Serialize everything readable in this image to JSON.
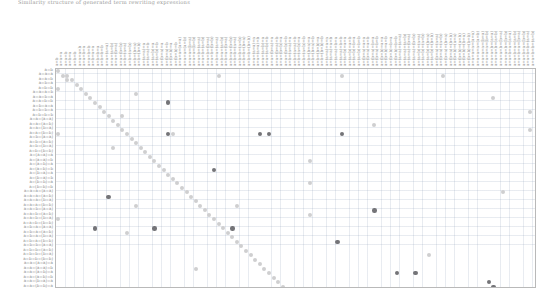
{
  "caption": {
    "text": "Similarity structure of generated term rewriting expressions"
  },
  "chart_data": {
    "type": "heatmap",
    "title": "",
    "xlabel": "",
    "ylabel": "",
    "grid": true,
    "legend": null,
    "n_rows": 49,
    "n_cols": 105,
    "cell_width_px": 4.58,
    "cell_height_px": 4.49,
    "colors": {
      "light_dot": "#d8d8d8",
      "mid_dot": "#c2c2c2",
      "dark_dot": "#6f6f73",
      "grid_line": "#c6cede",
      "panel_border": "#b9b9b9",
      "label_text": "#8e8e8e"
    },
    "row_labels": [
      "a=b",
      "a=a=a",
      "a=a=b",
      "a=b=a",
      "a=b=b",
      "a=a=a=b",
      "a=a=b=a",
      "a=a=b=b",
      "a=b=a=a",
      "a=b=b=a",
      "a=b=b=b",
      "a=a=(a=a)",
      "a=a=(a=b)",
      "a=a=(b=a)",
      "a=a=(b=b)",
      "a=b=(a=a)",
      "a=b=(a=b)",
      "a=b=(b=a)",
      "a=b=(b=b)",
      "a=(a=a)=a",
      "a=(a=a)=b",
      "a=(a=b)=a",
      "a=(a=b)=b",
      "a=(b=a)=a",
      "a=(b=a)=b",
      "a=(b=b)=a",
      "a=(b=b)=b",
      "a=a=a=(a=a)",
      "a=a=a=(a=b)",
      "a=a=a=(b=a)",
      "a=a=a=(b=b)",
      "a=a=b=(a=a)",
      "a=a=b=(a=b)",
      "a=a=b=(b=a)",
      "a=a=b=(b=b)",
      "a=b=a=(a=a)",
      "a=b=a=(a=b)",
      "a=b=a=(b=a)",
      "a=b=a=(b=b)",
      "a=b=b=(a=a)",
      "a=b=b=(a=b)",
      "a=b=b=(b=a)",
      "a=b=b=(b=b)",
      "a=a=(a=a)=a",
      "a=a=(a=a)=b",
      "a=a=(a=b)=a",
      "a=a=(a=b)=b",
      "a=a=(b=a)=a",
      "a=a=(b=b)=a"
    ],
    "col_labels": [
      "a=b",
      "a=a=a",
      "a=a=b",
      "a=b=a",
      "a=b=b",
      "a=a=a=b",
      "a=a=b=a",
      "a=a=b=b",
      "a=b=a=a",
      "a=b=b=a",
      "a=b=b=b",
      "a=a=(a=a)",
      "a=a=(a=b)",
      "a=a=(b=a)",
      "a=a=(b=b)",
      "a=b=(a=a)",
      "a=b=(a=b)",
      "a=b=(b=a)",
      "a=b=(b=b)",
      "a=(a=a)=a",
      "a=(a=a)=b",
      "a=(a=b)=a",
      "a=(a=b)=b",
      "a=(b=a)=a",
      "a=(b=a)=b",
      "a=(b=b)=a",
      "a=(b=b)=b",
      "a=a=a=(a=a)",
      "a=a=a=(a=b)",
      "a=a=a=(b=a)",
      "a=a=a=(b=b)",
      "a=a=b=(a=a)",
      "a=a=b=(a=b)",
      "a=a=b=(b=a)",
      "a=a=b=(b=b)",
      "a=b=a=(a=a)",
      "a=b=a=(a=b)",
      "a=b=a=(b=a)",
      "a=b=a=(b=b)",
      "a=b=b=(a=a)",
      "a=b=b=(a=b)",
      "a=b=b=(b=a)",
      "a=b=b=(b=b)",
      "a=a=(a=a)=a",
      "a=a=(a=a)=b",
      "a=a=(a=b)=a",
      "a=a=(a=b)=b",
      "a=a=(b=a)=a",
      "a=a=(b=a)=b",
      "a=a=(b=b)=a",
      "a=a=(b=b)=b",
      "a=b=(a=a)=a",
      "a=b=(a=a)=b",
      "a=b=(a=b)=a",
      "a=b=(a=b)=b",
      "a=b=(b=a)=a",
      "a=b=(b=a)=b",
      "a=b=(b=b)=a",
      "a=b=(b=b)=b",
      "a=(a=a)=a=a",
      "a=(a=a)=a=b",
      "a=(a=a)=b=a",
      "a=(a=a)=b=b",
      "a=(a=b)=a=a",
      "a=(a=b)=a=b",
      "a=(a=b)=b=a",
      "a=(a=b)=b=b",
      "a=(b=a)=a=a",
      "a=(b=a)=a=b",
      "a=(b=a)=b=a",
      "a=(b=a)=b=b",
      "a=(b=b)=a=a",
      "a=(b=b)=a=b",
      "a=(b=b)=b=a",
      "a=(b=b)=b=b",
      "a=(a=a)=(a=a)",
      "a=(a=a)=(a=b)",
      "a=(a=a)=(b=a)",
      "a=(a=a)=(b=b)",
      "a=(a=b)=(a=a)",
      "a=(a=b)=(a=b)",
      "a=(a=b)=(b=a)",
      "a=(a=b)=(b=b)",
      "a=(b=a)=(a=a)",
      "a=(b=a)=(a=b)",
      "a=(b=a)=(b=a)",
      "a=(b=a)=(b=b)",
      "a=(b=b)=(a=a)",
      "a=(b=b)=(a=b)",
      "a=(b=b)=(b=a)",
      "a=(b=b)=(b=b)",
      "a=a=a=a=(a=a)",
      "a=a=a=a=(a=b)",
      "a=a=a=a=(b=a)",
      "a=a=a=a=(b=b)",
      "a=a=a=b=(a=a)",
      "a=a=a=b=(a=b)",
      "a=a=a=b=(b=a)",
      "a=a=a=b=(b=b)",
      "a=a=b=a=(a=a)",
      "a=a=b=a=(a=b)",
      "a=a=b=a=(b=a)",
      "a=a=b=a=(b=b)",
      "a=a=b=b=(a=a)",
      "a=a=b=b=(a=b)"
    ],
    "points": [
      {
        "r": 0,
        "c": 0,
        "v": 0.3
      },
      {
        "r": 1,
        "c": 1,
        "v": 0.3
      },
      {
        "r": 1,
        "c": 2,
        "v": 0.3
      },
      {
        "r": 1,
        "c": 35,
        "v": 0.3
      },
      {
        "r": 1,
        "c": 62,
        "v": 0.3
      },
      {
        "r": 1,
        "c": 84,
        "v": 0.3
      },
      {
        "r": 2,
        "c": 2,
        "v": 0.3
      },
      {
        "r": 2,
        "c": 3,
        "v": 0.3
      },
      {
        "r": 3,
        "c": 4,
        "v": 0.3
      },
      {
        "r": 4,
        "c": 0,
        "v": 0.3
      },
      {
        "r": 4,
        "c": 5,
        "v": 0.3
      },
      {
        "r": 5,
        "c": 6,
        "v": 0.3
      },
      {
        "r": 5,
        "c": 17,
        "v": 0.3
      },
      {
        "r": 6,
        "c": 7,
        "v": 0.3
      },
      {
        "r": 6,
        "c": 95,
        "v": 0.3
      },
      {
        "r": 7,
        "c": 8,
        "v": 0.3
      },
      {
        "r": 7,
        "c": 24,
        "v": 0.82
      },
      {
        "r": 8,
        "c": 9,
        "v": 0.3
      },
      {
        "r": 9,
        "c": 10,
        "v": 0.3
      },
      {
        "r": 9,
        "c": 103,
        "v": 0.3
      },
      {
        "r": 10,
        "c": 11,
        "v": 0.3
      },
      {
        "r": 10,
        "c": 14,
        "v": 0.3
      },
      {
        "r": 11,
        "c": 12,
        "v": 0.3
      },
      {
        "r": 12,
        "c": 13,
        "v": 0.3
      },
      {
        "r": 12,
        "c": 69,
        "v": 0.3
      },
      {
        "r": 13,
        "c": 14,
        "v": 0.3
      },
      {
        "r": 13,
        "c": 103,
        "v": 0.3
      },
      {
        "r": 14,
        "c": 0,
        "v": 0.3
      },
      {
        "r": 14,
        "c": 15,
        "v": 0.3
      },
      {
        "r": 14,
        "c": 24,
        "v": 0.82
      },
      {
        "r": 14,
        "c": 25,
        "v": 0.3
      },
      {
        "r": 14,
        "c": 44,
        "v": 0.82
      },
      {
        "r": 14,
        "c": 46,
        "v": 0.82
      },
      {
        "r": 14,
        "c": 62,
        "v": 0.82
      },
      {
        "r": 15,
        "c": 16,
        "v": 0.3
      },
      {
        "r": 16,
        "c": 17,
        "v": 0.3
      },
      {
        "r": 17,
        "c": 12,
        "v": 0.3
      },
      {
        "r": 17,
        "c": 18,
        "v": 0.3
      },
      {
        "r": 18,
        "c": 19,
        "v": 0.3
      },
      {
        "r": 19,
        "c": 20,
        "v": 0.3
      },
      {
        "r": 20,
        "c": 21,
        "v": 0.3
      },
      {
        "r": 20,
        "c": 55,
        "v": 0.3
      },
      {
        "r": 21,
        "c": 22,
        "v": 0.3
      },
      {
        "r": 22,
        "c": 23,
        "v": 0.3
      },
      {
        "r": 22,
        "c": 34,
        "v": 0.82
      },
      {
        "r": 23,
        "c": 24,
        "v": 0.3
      },
      {
        "r": 24,
        "c": 25,
        "v": 0.3
      },
      {
        "r": 25,
        "c": 26,
        "v": 0.3
      },
      {
        "r": 25,
        "c": 55,
        "v": 0.3
      },
      {
        "r": 26,
        "c": 27,
        "v": 0.3
      },
      {
        "r": 27,
        "c": 28,
        "v": 0.3
      },
      {
        "r": 27,
        "c": 97,
        "v": 0.3
      },
      {
        "r": 28,
        "c": 11,
        "v": 0.82
      },
      {
        "r": 28,
        "c": 29,
        "v": 0.3
      },
      {
        "r": 29,
        "c": 30,
        "v": 0.3
      },
      {
        "r": 30,
        "c": 17,
        "v": 0.3
      },
      {
        "r": 30,
        "c": 31,
        "v": 0.3
      },
      {
        "r": 30,
        "c": 39,
        "v": 0.3
      },
      {
        "r": 31,
        "c": 32,
        "v": 0.3
      },
      {
        "r": 31,
        "c": 69,
        "v": 0.82
      },
      {
        "r": 32,
        "c": 33,
        "v": 0.3
      },
      {
        "r": 32,
        "c": 55,
        "v": 0.3
      },
      {
        "r": 33,
        "c": 0,
        "v": 0.3
      },
      {
        "r": 33,
        "c": 34,
        "v": 0.3
      },
      {
        "r": 34,
        "c": 35,
        "v": 0.3
      },
      {
        "r": 35,
        "c": 8,
        "v": 0.82
      },
      {
        "r": 35,
        "c": 36,
        "v": 0.3
      },
      {
        "r": 35,
        "c": 21,
        "v": 0.82
      },
      {
        "r": 35,
        "c": 38,
        "v": 0.82
      },
      {
        "r": 36,
        "c": 37,
        "v": 0.3
      },
      {
        "r": 36,
        "c": 15,
        "v": 0.3
      },
      {
        "r": 37,
        "c": 38,
        "v": 0.3
      },
      {
        "r": 38,
        "c": 39,
        "v": 0.3
      },
      {
        "r": 38,
        "c": 61,
        "v": 0.82
      },
      {
        "r": 39,
        "c": 40,
        "v": 0.3
      },
      {
        "r": 40,
        "c": 41,
        "v": 0.3
      },
      {
        "r": 41,
        "c": 42,
        "v": 0.3
      },
      {
        "r": 41,
        "c": 81,
        "v": 0.3
      },
      {
        "r": 42,
        "c": 43,
        "v": 0.3
      },
      {
        "r": 43,
        "c": 44,
        "v": 0.3
      },
      {
        "r": 44,
        "c": 45,
        "v": 0.3
      },
      {
        "r": 44,
        "c": 30,
        "v": 0.3
      },
      {
        "r": 45,
        "c": 46,
        "v": 0.3
      },
      {
        "r": 45,
        "c": 74,
        "v": 0.82
      },
      {
        "r": 45,
        "c": 78,
        "v": 0.82
      },
      {
        "r": 46,
        "c": 47,
        "v": 0.3
      },
      {
        "r": 47,
        "c": 48,
        "v": 0.3
      },
      {
        "r": 47,
        "c": 94,
        "v": 0.82
      },
      {
        "r": 48,
        "c": 49,
        "v": 0.3
      },
      {
        "r": 48,
        "c": 95,
        "v": 0.82
      }
    ]
  }
}
